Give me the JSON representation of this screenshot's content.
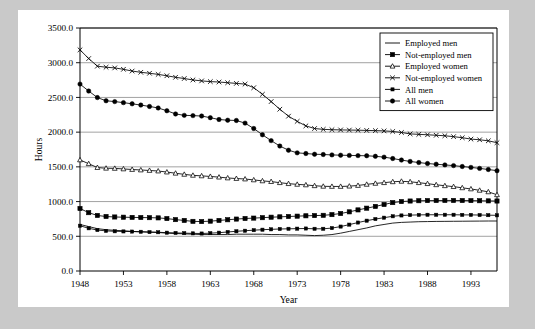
{
  "chart_data": {
    "type": "line",
    "title": "",
    "xlabel": "Year",
    "ylabel": "Hours",
    "xlim": [
      1948,
      1996
    ],
    "ylim": [
      0.0,
      3500.0
    ],
    "grid": true,
    "legend_position": "top-right",
    "x_ticks": [
      "1948",
      "1953",
      "1958",
      "1963",
      "1968",
      "1973",
      "1978",
      "1983",
      "1988",
      "1993"
    ],
    "x_tick_values": [
      1948,
      1953,
      1958,
      1963,
      1968,
      1973,
      1978,
      1983,
      1988,
      1993
    ],
    "y_ticks": [
      "0.0",
      "500.0",
      "1000.0",
      "1500.0",
      "2000.0",
      "2500.0",
      "3000.0",
      "3500.0"
    ],
    "y_tick_values": [
      0.0,
      500.0,
      1000.0,
      1500.0,
      2000.0,
      2500.0,
      3000.0,
      3500.0
    ],
    "x": [
      1948,
      1949,
      1950,
      1951,
      1952,
      1953,
      1954,
      1955,
      1956,
      1957,
      1958,
      1959,
      1960,
      1961,
      1962,
      1963,
      1964,
      1965,
      1966,
      1967,
      1968,
      1969,
      1970,
      1971,
      1972,
      1973,
      1974,
      1975,
      1976,
      1977,
      1978,
      1979,
      1980,
      1981,
      1982,
      1983,
      1984,
      1985,
      1986,
      1987,
      1988,
      1989,
      1990,
      1991,
      1992,
      1993,
      1994,
      1995,
      1996
    ],
    "series": [
      {
        "name": "Employed men",
        "marker": "none",
        "values": [
          670,
          640,
          610,
          595,
          585,
          580,
          570,
          565,
          560,
          555,
          545,
          540,
          535,
          530,
          525,
          525,
          525,
          525,
          530,
          530,
          530,
          530,
          525,
          525,
          520,
          520,
          515,
          510,
          515,
          525,
          545,
          570,
          595,
          620,
          650,
          670,
          690,
          700,
          705,
          710,
          712,
          714,
          715,
          716,
          717,
          718,
          719,
          720,
          720
        ]
      },
      {
        "name": "Not-employed men",
        "marker": "square-filled",
        "values": [
          900,
          840,
          800,
          785,
          778,
          775,
          772,
          770,
          768,
          765,
          755,
          740,
          728,
          715,
          712,
          718,
          728,
          738,
          748,
          756,
          762,
          768,
          775,
          780,
          785,
          790,
          795,
          798,
          802,
          812,
          828,
          852,
          880,
          905,
          930,
          958,
          985,
          1000,
          1008,
          1012,
          1014,
          1015,
          1016,
          1016,
          1015,
          1014,
          1012,
          1010,
          1008
        ]
      },
      {
        "name": "Employed women",
        "marker": "triangle-open",
        "values": [
          1600,
          1545,
          1490,
          1480,
          1478,
          1470,
          1462,
          1455,
          1448,
          1440,
          1425,
          1408,
          1392,
          1378,
          1370,
          1362,
          1352,
          1340,
          1332,
          1325,
          1312,
          1298,
          1288,
          1272,
          1258,
          1248,
          1240,
          1228,
          1220,
          1218,
          1218,
          1222,
          1232,
          1248,
          1262,
          1272,
          1285,
          1292,
          1285,
          1272,
          1258,
          1242,
          1228,
          1215,
          1198,
          1182,
          1162,
          1140,
          1098
        ]
      },
      {
        "name": "Not-employed women",
        "marker": "cross",
        "values": [
          3185,
          3060,
          2950,
          2935,
          2925,
          2905,
          2880,
          2862,
          2848,
          2832,
          2812,
          2790,
          2772,
          2752,
          2738,
          2728,
          2722,
          2712,
          2702,
          2692,
          2640,
          2545,
          2440,
          2330,
          2230,
          2155,
          2090,
          2052,
          2040,
          2035,
          2032,
          2030,
          2028,
          2025,
          2022,
          2018,
          2010,
          1995,
          1975,
          1968,
          1962,
          1955,
          1948,
          1935,
          1920,
          1900,
          1890,
          1875,
          1848
        ]
      },
      {
        "name": "All men",
        "marker": "square-small",
        "values": [
          652,
          615,
          590,
          578,
          572,
          570,
          568,
          565,
          560,
          558,
          552,
          548,
          545,
          542,
          540,
          545,
          552,
          562,
          572,
          580,
          588,
          595,
          600,
          605,
          608,
          610,
          612,
          608,
          608,
          618,
          640,
          668,
          698,
          725,
          748,
          768,
          788,
          800,
          805,
          808,
          810,
          810,
          810,
          810,
          808,
          808,
          806,
          804,
          802
        ]
      },
      {
        "name": "All women",
        "marker": "circle-filled",
        "values": [
          2692,
          2592,
          2498,
          2452,
          2440,
          2425,
          2408,
          2390,
          2370,
          2348,
          2308,
          2262,
          2242,
          2238,
          2232,
          2208,
          2182,
          2172,
          2168,
          2130,
          2052,
          1962,
          1878,
          1800,
          1740,
          1702,
          1692,
          1682,
          1678,
          1672,
          1668,
          1665,
          1662,
          1660,
          1652,
          1640,
          1620,
          1598,
          1578,
          1562,
          1548,
          1538,
          1528,
          1518,
          1505,
          1492,
          1478,
          1462,
          1445
        ]
      }
    ]
  },
  "legend": {
    "items": [
      {
        "label": "Employed men"
      },
      {
        "label": "Not-employed men"
      },
      {
        "label": "Employed women"
      },
      {
        "label": "Not-employed women"
      },
      {
        "label": "All men"
      },
      {
        "label": "All women"
      }
    ]
  },
  "colors": {
    "line": "#000000",
    "grid": "#8a8a8a",
    "panel_bg": "#ffffff",
    "page_bg": "#c9c9c9"
  }
}
